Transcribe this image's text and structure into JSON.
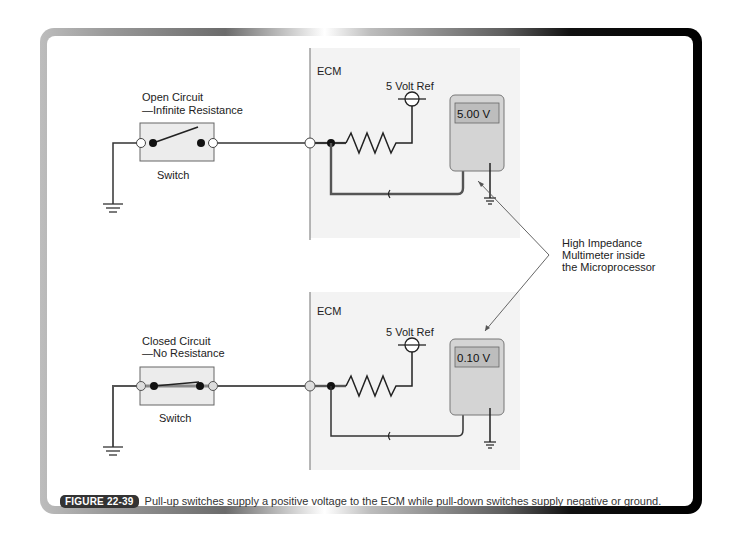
{
  "figure": {
    "badge": "FIGURE 22-39",
    "caption": "Pull-up switches supply a positive voltage to the ECM while pull-down switches supply negative or ground."
  },
  "top_circuit": {
    "state_label_line1": "Open Circuit",
    "state_label_line2": "—Infinite Resistance",
    "switch_label": "Switch",
    "ecm_label": "ECM",
    "ref_label": "5 Volt Ref",
    "meter_reading": "5.00 V"
  },
  "bottom_circuit": {
    "state_label_line1": "Closed Circuit",
    "state_label_line2": "—No Resistance",
    "switch_label": "Switch",
    "ecm_label": "ECM",
    "ref_label": "5 Volt Ref",
    "meter_reading": "0.10 V"
  },
  "callout": {
    "line1": "High Impedance",
    "line2": "Multimeter inside",
    "line3": "the Microprocessor"
  },
  "colors": {
    "ecm_panel": "#f3f3f3",
    "meter_body": "#d4d4d4",
    "meter_display": "#bdbdbd",
    "wire": "#333333",
    "switch_box": "#ececec",
    "badge_bg": "#333333"
  }
}
